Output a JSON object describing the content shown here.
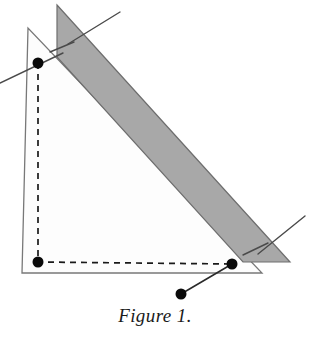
{
  "figure": {
    "caption": "Figure 1.",
    "colors": {
      "background": "#ffffff",
      "band_fill": "#a8a8a8",
      "band_stroke": "#6e6e6e",
      "triangle_fill": "#fdfdfd",
      "triangle_stroke": "#787878",
      "dashed_stroke": "#1a1a1a",
      "line_stroke": "#4a4a4a",
      "dot_fill": "#0a0a0a"
    },
    "chart_data": {
      "type": "diagram",
      "title": "Figure 1.",
      "xlabel": "",
      "ylabel": "",
      "description": "Geometric construction: an outlined right triangle overlaid by a shaded diagonal band, with a dashed inner triangle joining three marked points and a fourth point linked by a solid segment.",
      "outer_triangle": {
        "name": "outer-triangle",
        "fill": "#fdfdfd",
        "stroke": "#787878",
        "points": [
          [
            28,
            28
          ],
          [
            22,
            273
          ],
          [
            262,
            273
          ]
        ]
      },
      "shaded_band": {
        "name": "shaded-band",
        "fill": "#a8a8a8",
        "stroke": "#6e6e6e",
        "points": [
          [
            57,
            5
          ],
          [
            290,
            262
          ],
          [
            243,
            262
          ],
          [
            57,
            57
          ]
        ]
      },
      "dashed_triangle": {
        "name": "dashed-triangle",
        "stroke": "#1a1a1a",
        "dash": [
          6,
          5
        ],
        "points": [
          [
            38,
            63
          ],
          [
            38,
            262
          ],
          [
            232,
            264
          ]
        ]
      },
      "vertices": [
        {
          "name": "vertex-top-left",
          "x": 38,
          "y": 63,
          "r": 5.5
        },
        {
          "name": "vertex-bottom-left",
          "x": 38,
          "y": 262,
          "r": 5.5
        },
        {
          "name": "vertex-bottom-right",
          "x": 232,
          "y": 264,
          "r": 5.5
        },
        {
          "name": "point-free",
          "x": 181,
          "y": 294,
          "r": 5.5
        }
      ],
      "segments": [
        {
          "name": "connector-segment",
          "x1": 181,
          "y1": 294,
          "x2": 232,
          "y2": 264,
          "stroke": "#2a2a2a",
          "width": 1.6
        },
        {
          "name": "construction-line-left",
          "x1": 0,
          "y1": 83,
          "x2": 63,
          "y2": 53,
          "stroke": "#4a4a4a",
          "width": 1.4
        },
        {
          "name": "construction-line-top",
          "x1": 120,
          "y1": 12,
          "x2": 68,
          "y2": 44,
          "stroke": "#4a4a4a",
          "width": 1.4
        },
        {
          "name": "tick-band-left",
          "x1": 50,
          "y1": 52,
          "x2": 74,
          "y2": 42,
          "stroke": "#4a4a4a",
          "width": 1.4
        },
        {
          "name": "construction-line-right",
          "x1": 305,
          "y1": 216,
          "x2": 258,
          "y2": 254,
          "stroke": "#4a4a4a",
          "width": 1.4
        },
        {
          "name": "tick-band-right",
          "x1": 243,
          "y1": 255,
          "x2": 268,
          "y2": 243,
          "stroke": "#4a4a4a",
          "width": 1.4
        }
      ]
    }
  }
}
